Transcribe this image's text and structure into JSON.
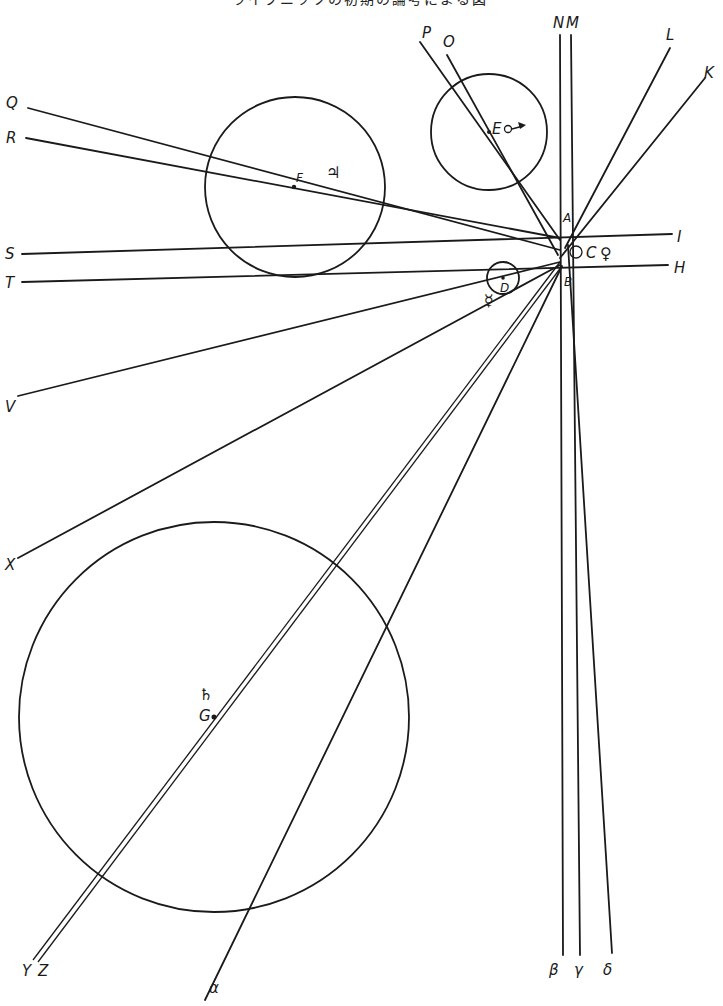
{
  "caption": {
    "partial_text": "ライプニッツの初期の論考による図"
  },
  "convergence": {
    "labels": [
      "A",
      "B",
      "C",
      "D"
    ],
    "planet_symbols": {
      "C": "♀",
      "D": "☿"
    }
  },
  "bodies": [
    {
      "id": "E",
      "label": "E",
      "symbol": "♂→",
      "cx": 489,
      "cy": 132,
      "r": 58
    },
    {
      "id": "F",
      "label": "F",
      "symbol": "♃",
      "cx": 295,
      "cy": 187,
      "r": 90
    },
    {
      "id": "D",
      "label": "D",
      "symbol": "☿",
      "cx": 503,
      "cy": 278,
      "r": 16
    },
    {
      "id": "G",
      "label": "G",
      "symbol": "♄",
      "cx": 214,
      "cy": 717,
      "r": 195
    }
  ],
  "line_labels": {
    "left": [
      "Q",
      "R",
      "S",
      "T",
      "V",
      "X"
    ],
    "top": [
      "P",
      "O",
      "N",
      "M",
      "L",
      "K"
    ],
    "right": [
      "I",
      "H"
    ],
    "bottom": [
      "Y",
      "Z",
      "α",
      "β",
      "γ",
      "δ"
    ]
  },
  "labels": {
    "Q": "Q",
    "R": "R",
    "S": "S",
    "T": "T",
    "V": "V",
    "X": "X",
    "P": "P",
    "O": "O",
    "N": "N",
    "M": "M",
    "L": "L",
    "K": "K",
    "I": "I",
    "H": "H",
    "Y": "Y",
    "Z": "Z",
    "alpha": "α",
    "beta": "β",
    "gamma": "γ",
    "delta": "δ",
    "A": "A",
    "B": "B",
    "C": "C",
    "D": "D",
    "E": "E",
    "F": "F",
    "G": "G",
    "venus": "♀",
    "mercury": "☿",
    "mars_arrow": "⟶",
    "jupiter": "♃",
    "saturn": "♄"
  }
}
